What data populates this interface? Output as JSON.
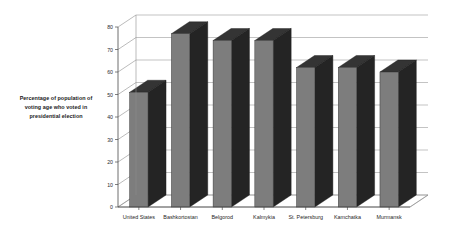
{
  "annotation": {
    "line1": "Percentage of population of",
    "line2": "voting age who voted in",
    "line3": "presidential election"
  },
  "colors": {
    "bar_front": "#7d7d7d",
    "bar_side": "#242424",
    "bar_top": "#343434",
    "gridline": "#9a9a9a",
    "axis": "#4a4a4a",
    "background": "#ffffff",
    "text": "#1f1f1f"
  },
  "chart_data": {
    "type": "bar",
    "title": "",
    "subtitle": "",
    "xlabel": "",
    "ylabel": "Percentage of population of voting age who voted in presidential election",
    "categories": [
      "United States",
      "Bashkortostan",
      "Belgorod",
      "Kalmykia",
      "St. Petersburg",
      "Kamchatka",
      "Murmansk"
    ],
    "values": [
      51,
      77,
      74,
      74,
      62,
      62,
      60
    ],
    "ylim": [
      0,
      80
    ],
    "yticks": [
      0,
      10,
      20,
      30,
      40,
      50,
      60,
      70,
      80
    ],
    "ytick_labels": [
      "0",
      "10",
      "20",
      "30",
      "40",
      "50",
      "60",
      "70",
      "80"
    ],
    "grid": true,
    "legend": false,
    "legend_position": "none",
    "style": "3d-column"
  }
}
